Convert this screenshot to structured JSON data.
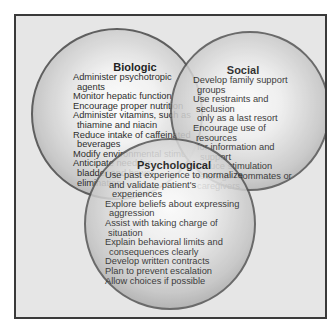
{
  "diagram": {
    "type": "venn",
    "circles": [
      {
        "id": "biologic",
        "title": "Biologic",
        "items": [
          "Administer psychotropic agents",
          "Monitor hepatic function",
          "Encourage proper nutrition",
          "Administer vitamins, such as thiamine and niacin",
          "Reduce intake of caffeinated beverages",
          "Modify environmental stimuli",
          "Anticipate need for bladder and bowel elimination"
        ],
        "lines": [
          "Administer psychotropic",
          "agents",
          "Monitor hepatic function",
          "Encourage proper nutrition",
          "Administer vitamins, such as",
          "thiamine and niacin",
          "Reduce intake of caffeinated",
          "beverages",
          "Modify environmental stimuli",
          "Anticipate need for",
          "bladder and bowel",
          "elimination"
        ]
      },
      {
        "id": "social",
        "title": "Social",
        "items": [
          "Develop family support groups",
          "Use restraints and seclusion only as a last resort",
          "Encourage use of resources for information and support",
          "Reduce stimulation",
          "Reassign roommates or caregivers"
        ],
        "lines": [
          "Develop family support",
          "groups",
          "Use restraints and seclusion",
          "only as a last resort",
          "Encourage use of resources",
          "for information and support",
          "Reduce stimulation",
          "Reassign roommates or",
          "caregivers"
        ]
      },
      {
        "id": "psychological",
        "title": "Psychological",
        "items": [
          "Use past experience to normalize and validate patient's experiences",
          "Explore beliefs about expressing aggression",
          "Assist with taking charge of situation",
          "Explain behavioral limits and consequences clearly",
          "Develop written contracts",
          "Plan to prevent escalation",
          "Allow choices if possible"
        ],
        "lines": [
          "Use past experience to normalize",
          "and validate patient's experiences",
          "Explore beliefs about expressing",
          "aggression",
          "Assist with taking charge of situation",
          "Explain behavioral limits and",
          "consequences clearly",
          "Develop written contracts",
          "Plan to prevent escalation",
          "Allow choices if possible"
        ]
      }
    ],
    "colors": {
      "frame_border": "#3a3a3a",
      "frame_background": "#e6e6e6",
      "circle_border": "#555555",
      "text": "#1a1a1a"
    }
  }
}
